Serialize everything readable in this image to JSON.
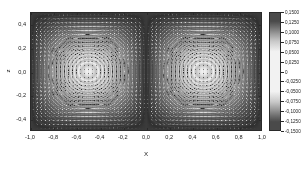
{
  "figure": {
    "background": "#ffffff",
    "frame_color": "#2a2a2a"
  },
  "axes": {
    "x_title": "X",
    "y_title": "z",
    "x_ticks": [
      "-1,0",
      "-0,8",
      "-0,6",
      "-0,4",
      "-0,2",
      "0,0",
      "0,2",
      "0,4",
      "0,6",
      "0,8",
      "1,0"
    ],
    "x_tick_values": [
      -1.0,
      -0.8,
      -0.6,
      -0.4,
      -0.2,
      0.0,
      0.2,
      0.4,
      0.6,
      0.8,
      1.0
    ],
    "y_ticks": [
      "0,4",
      "0,2",
      "0,0",
      "-0,2",
      "-0,4"
    ],
    "y_tick_values": [
      0.4,
      0.2,
      0.0,
      -0.2,
      -0.4
    ]
  },
  "colorbar": {
    "ticks": [
      "0,1500",
      "0,1250",
      "0,1000",
      "0,0750",
      "0,0500",
      "0,0250",
      "0",
      "-0,0250",
      "-0,0500",
      "-0,0750",
      "-0,1000",
      "-0,1250",
      "-0,1500"
    ],
    "tick_values": [
      0.15,
      0.125,
      0.1,
      0.075,
      0.05,
      0.025,
      0,
      -0.025,
      -0.05,
      -0.075,
      -0.1,
      -0.125,
      -0.15
    ],
    "vmin": -0.15,
    "vmax": 0.15,
    "colormap": "grayscale-diverging",
    "dark_color": "#4a4a4a",
    "light_color": "#f2f2f2"
  },
  "chart_data": {
    "type": "heatmap",
    "title": "",
    "xlabel": "X",
    "ylabel": "z",
    "xlim": [
      -1.0,
      1.0
    ],
    "ylim": [
      -0.5,
      0.5
    ],
    "grid": false,
    "legend": "colorbar-right",
    "field": "stream-function contour with velocity vector overlay",
    "x_tick_labels": [
      "-1,0",
      "-0,8",
      "-0,6",
      "-0,4",
      "-0,2",
      "0,0",
      "0,2",
      "0,4",
      "0,6",
      "0,8",
      "1,0"
    ],
    "y_tick_labels": [
      "0,4",
      "0,2",
      "0,0",
      "-0,2",
      "-0,4"
    ],
    "colorbar_tick_labels": [
      "0,1500",
      "0,1250",
      "0,1000",
      "0,0750",
      "0,0500",
      "0,0250",
      "0",
      "-0,0250",
      "-0,0500",
      "-0,0750",
      "-0,1000",
      "-0,1250",
      "-0,1500"
    ],
    "zlim": [
      -0.15,
      0.15
    ],
    "vortices": [
      {
        "name": "left-vortex",
        "center_x": -0.52,
        "center_y": 0.02,
        "circulation": 0.15,
        "rotation": "counter-clockwise"
      },
      {
        "name": "right-vortex",
        "center_x": 0.52,
        "center_y": 0.02,
        "circulation": -0.15,
        "rotation": "clockwise"
      }
    ],
    "vector_grid": {
      "nx": 58,
      "ny": 30,
      "arrow_style": "line-with-head"
    },
    "annotations": []
  }
}
